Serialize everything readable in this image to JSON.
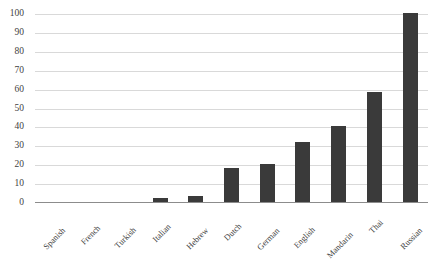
{
  "chart_data": {
    "type": "bar",
    "title": "",
    "subtitle": "",
    "xlabel": "",
    "ylabel": "",
    "categories": [
      "Spanish",
      "French",
      "Turkish",
      "Italian",
      "Hebrew",
      "Dutch",
      "German",
      "English",
      "Mandarin",
      "Thai",
      "Russian"
    ],
    "values": [
      0,
      0,
      0,
      2,
      3,
      18,
      20,
      32,
      40,
      58,
      100
    ],
    "series": [
      {
        "name": "",
        "values": [
          0,
          0,
          0,
          2,
          3,
          18,
          20,
          32,
          40,
          58,
          100
        ]
      }
    ],
    "ylim": [
      0,
      100
    ],
    "ytick_labels": [
      "100",
      "90",
      "80",
      "70",
      "60",
      "50",
      "40",
      "30",
      "20",
      "10",
      "0"
    ],
    "ytick_values": [
      100,
      90,
      80,
      70,
      60,
      50,
      40,
      30,
      20,
      10,
      0
    ],
    "ytick_step": 10,
    "grid": true,
    "grid_axis": "y",
    "legend": false,
    "legend_position": "none",
    "bar_color": "#3a3a3a",
    "grid_color": "#d9d9d9",
    "axis_color": "#8c8c8c",
    "tick_label_color": "#3f3f3f",
    "category_label_rotation": -45,
    "annotations": []
  }
}
